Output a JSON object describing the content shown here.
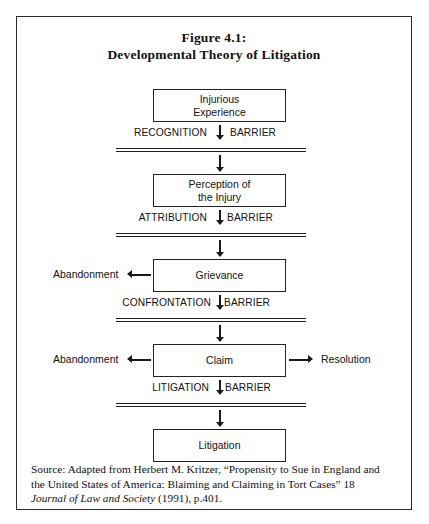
{
  "figure": {
    "title_line1": "Figure 4.1:",
    "title_line2": "Developmental Theory of Litigation"
  },
  "flow": {
    "nodes": [
      {
        "id": "injurious-experience",
        "line1": "Injurious",
        "line2": "Experience"
      },
      {
        "id": "perception-of-injury",
        "line1": "Perception of",
        "line2": "the Injury"
      },
      {
        "id": "grievance",
        "line1": "Grievance",
        "line2": ""
      },
      {
        "id": "claim",
        "line1": "Claim",
        "line2": ""
      },
      {
        "id": "litigation",
        "line1": "Litigation",
        "line2": ""
      }
    ],
    "barriers": [
      {
        "id": "recognition-barrier",
        "left": "RECOGNITION",
        "right": "BARRIER",
        "arrow": "down-arrow-icon"
      },
      {
        "id": "attribution-barrier",
        "left": "ATTRIBUTION",
        "right": "BARRIER",
        "arrow": "down-arrow-icon"
      },
      {
        "id": "confrontation-barrier",
        "left": "CONFRONTATION",
        "right": "BARRIER",
        "arrow": "down-arrow-icon"
      },
      {
        "id": "litigation-barrier",
        "left": "LITIGATION",
        "right": "BARRIER",
        "arrow": "down-arrow-icon"
      }
    ],
    "side_outcomes": [
      {
        "id": "grievance-abandonment",
        "label": "Abandonment",
        "direction": "left"
      },
      {
        "id": "claim-abandonment",
        "label": "Abandonment",
        "direction": "left"
      },
      {
        "id": "claim-resolution",
        "label": "Resolution",
        "direction": "right"
      }
    ]
  },
  "source": {
    "line1": "Source: Adapted from Herbert M. Kritzer, “Propensity to Sue in England and",
    "line2": "the United States of America: Blaiming and Claiming in Tort Cases” 18",
    "line3_italic": "Journal of Law and Society",
    "line3_rest": " (1991), p.401."
  },
  "colors": {
    "ink": "#111111",
    "rule": "#1f1f1f",
    "frame": "#2b2b2b",
    "page": "#ffffff"
  }
}
